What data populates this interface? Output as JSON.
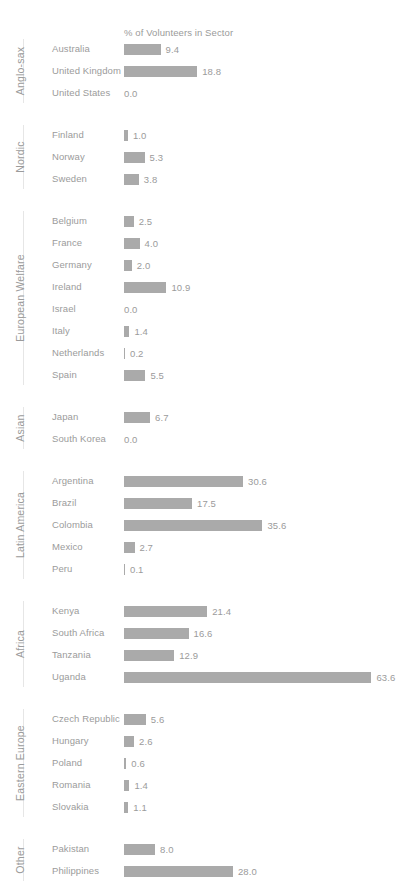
{
  "chart_data": {
    "type": "bar",
    "orientation": "horizontal",
    "title": "% of Volunteers in Sector",
    "xlabel": "",
    "ylabel": "",
    "xlim": [
      0,
      63.6
    ],
    "grid": false,
    "legend": false,
    "bar_color": "#aaaaaa",
    "text_color": "#9b9b9b",
    "groups": [
      {
        "label": "Anglo-sax",
        "categories": [
          "Australia",
          "United Kingdom",
          "United States"
        ],
        "values": [
          9.4,
          18.8,
          0.0
        ],
        "labels": [
          "9.4",
          "18.8",
          "0.0"
        ]
      },
      {
        "label": "Nordic",
        "categories": [
          "Finland",
          "Norway",
          "Sweden"
        ],
        "values": [
          1.0,
          5.3,
          3.8
        ],
        "labels": [
          "1.0",
          "5.3",
          "3.8"
        ]
      },
      {
        "label": "European Welfare",
        "categories": [
          "Belgium",
          "France",
          "Germany",
          "Ireland",
          "Israel",
          "Italy",
          "Netherlands",
          "Spain"
        ],
        "values": [
          2.5,
          4.0,
          2.0,
          10.9,
          0.0,
          1.4,
          0.2,
          5.5
        ],
        "labels": [
          "2.5",
          "4.0",
          "2.0",
          "10.9",
          "0.0",
          "1.4",
          "0.2",
          "5.5"
        ]
      },
      {
        "label": "Asian",
        "categories": [
          "Japan",
          "South Korea"
        ],
        "values": [
          6.7,
          0.0
        ],
        "labels": [
          "6.7",
          "0.0"
        ]
      },
      {
        "label": "Latin America",
        "categories": [
          "Argentina",
          "Brazil",
          "Colombia",
          "Mexico",
          "Peru"
        ],
        "values": [
          30.6,
          17.5,
          35.6,
          2.7,
          0.1
        ],
        "labels": [
          "30.6",
          "17.5",
          "35.6",
          "2.7",
          "0.1"
        ]
      },
      {
        "label": "Africa",
        "categories": [
          "Kenya",
          "South Africa",
          "Tanzania",
          "Uganda"
        ],
        "values": [
          21.4,
          16.6,
          12.9,
          63.6
        ],
        "labels": [
          "21.4",
          "16.6",
          "12.9",
          "63.6"
        ]
      },
      {
        "label": "Eastern Europe",
        "categories": [
          "Czech Republic",
          "Hungary",
          "Poland",
          "Romania",
          "Slovakia"
        ],
        "values": [
          5.6,
          2.6,
          0.6,
          1.4,
          1.1
        ],
        "labels": [
          "5.6",
          "2.6",
          "0.6",
          "1.4",
          "1.1"
        ]
      },
      {
        "label": "Other",
        "categories": [
          "Pakistan",
          "Philippines"
        ],
        "values": [
          8.0,
          28.0
        ],
        "labels": [
          "8.0",
          "28.0"
        ]
      }
    ]
  }
}
